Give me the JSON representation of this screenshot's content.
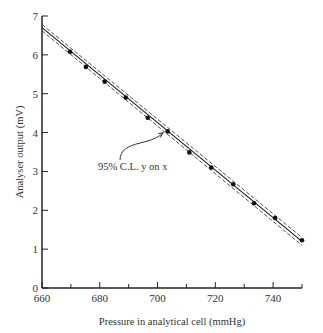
{
  "chart_data": {
    "type": "scatter",
    "title": "",
    "xlabel": "Pressure in analytical cell (mmHg)",
    "ylabel": "Analyser output (mV)",
    "xlim": [
      660,
      750
    ],
    "ylim": [
      0,
      7
    ],
    "x_ticks": [
      660,
      680,
      700,
      720,
      740
    ],
    "x_minor_ticks": [
      670,
      690,
      710,
      730,
      750
    ],
    "y_ticks": [
      0,
      1,
      2,
      3,
      4,
      5,
      6,
      7
    ],
    "grid": false,
    "legend": null,
    "series": [
      {
        "name": "Measured points",
        "type": "scatter",
        "x": [
          669.7,
          675.2,
          681.7,
          689.0,
          696.6,
          703.5,
          711.0,
          718.6,
          726.2,
          733.4,
          740.7,
          750.0
        ],
        "y": [
          6.08,
          5.69,
          5.31,
          4.9,
          4.38,
          4.03,
          3.49,
          3.1,
          2.67,
          2.18,
          1.8,
          1.23
        ]
      },
      {
        "name": "Regression line y on x",
        "type": "line",
        "x": [
          660,
          750
        ],
        "y": [
          6.7,
          1.2
        ]
      },
      {
        "name": "95% C.L. upper",
        "type": "line",
        "style": "dashed",
        "x": [
          660,
          750
        ],
        "y": [
          6.78,
          1.3
        ]
      },
      {
        "name": "95% C.L. lower",
        "type": "line",
        "style": "dashed",
        "x": [
          660,
          750
        ],
        "y": [
          6.62,
          1.1
        ]
      }
    ],
    "annotations": [
      {
        "text": "95% C.L. y on x",
        "x": 680,
        "y": 3.3,
        "arrow_to": [
          703,
          4.05
        ]
      }
    ]
  },
  "labels": {
    "x_axis_title": "Pressure in analytical cell (mmHg)",
    "y_axis_title": "Analyser output (mV)",
    "annotation": "95% C.L. y on x",
    "x_tick_labels": [
      "660",
      "680",
      "700",
      "720",
      "740"
    ],
    "y_tick_labels": [
      "0",
      "1",
      "2",
      "3",
      "4",
      "5",
      "6",
      "7"
    ]
  },
  "colors": {
    "ink": "#222222",
    "background": "#ffffff"
  }
}
